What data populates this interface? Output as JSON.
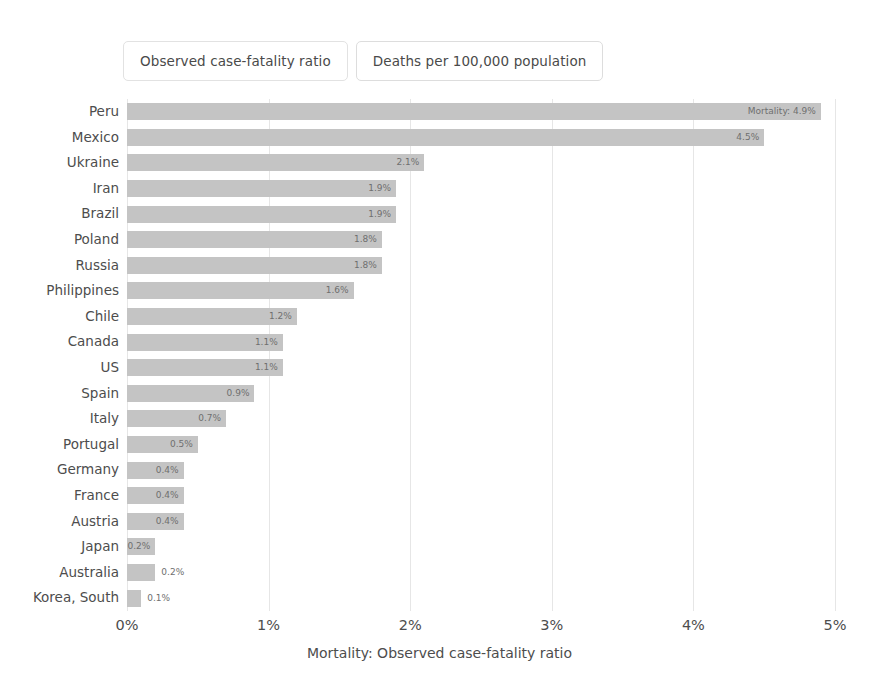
{
  "tabs": [
    {
      "label": "Observed case-fatality ratio",
      "active": true
    },
    {
      "label": "Deaths per 100,000 population",
      "active": false
    }
  ],
  "chart_data": {
    "type": "bar",
    "orientation": "horizontal",
    "title": "",
    "xlabel": "Mortality: Observed case-fatality ratio",
    "ylabel": "",
    "xlim": [
      0,
      5
    ],
    "xticks": [
      "0%",
      "1%",
      "2%",
      "3%",
      "4%",
      "5%"
    ],
    "xtick_values": [
      0,
      1,
      2,
      3,
      4,
      5
    ],
    "grid": true,
    "legend": "none",
    "bar_color": "#c4c4c4",
    "categories": [
      "Peru",
      "Mexico",
      "Ukraine",
      "Iran",
      "Brazil",
      "Poland",
      "Russia",
      "Philippines",
      "Chile",
      "Canada",
      "US",
      "Spain",
      "Italy",
      "Portugal",
      "Germany",
      "France",
      "Austria",
      "Japan",
      "Australia",
      "Korea, South"
    ],
    "values": [
      4.9,
      4.5,
      2.1,
      1.9,
      1.9,
      1.8,
      1.8,
      1.6,
      1.2,
      1.1,
      1.1,
      0.9,
      0.7,
      0.5,
      0.4,
      0.4,
      0.4,
      0.2,
      0.2,
      0.1
    ],
    "data_labels": [
      "Mortality: 4.9%",
      "4.5%",
      "2.1%",
      "1.9%",
      "1.9%",
      "1.8%",
      "1.8%",
      "1.6%",
      "1.2%",
      "1.1%",
      "1.1%",
      "0.9%",
      "0.7%",
      "0.5%",
      "0.4%",
      "0.4%",
      "0.4%",
      "0.2%",
      "0.2%",
      "0.1%"
    ],
    "label_placement": [
      "inside",
      "inside",
      "inside",
      "inside",
      "inside",
      "inside",
      "inside",
      "inside",
      "inside",
      "inside",
      "inside",
      "inside",
      "inside",
      "inside",
      "inside",
      "inside",
      "inside",
      "inside",
      "outside",
      "outside"
    ]
  }
}
